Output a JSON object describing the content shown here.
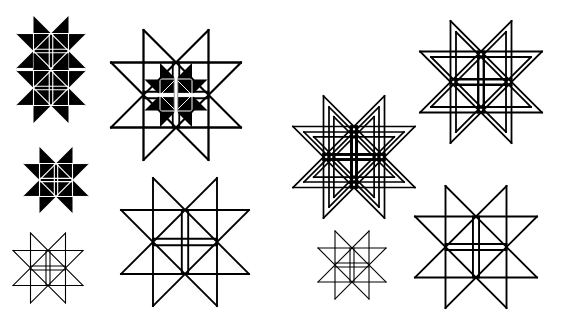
{
  "canvas": {
    "width": 562,
    "height": 336,
    "background": "#ffffff",
    "ink": "#000000"
  },
  "figures": [
    {
      "id": "double-filled-star",
      "style": "filled",
      "cx": 51,
      "cy": 51,
      "a": 17.5,
      "stroke": 1.6,
      "stack": [
        0,
        37
      ]
    },
    {
      "id": "outline-star-with-filled-core",
      "style": "outline",
      "cx": 176,
      "cy": 95,
      "a": 32.5,
      "stroke": 1.8,
      "core": {
        "style": "filled-quad",
        "a": 16
      }
    },
    {
      "id": "filled-star",
      "style": "filled",
      "cx": 56,
      "cy": 180,
      "a": 16.5,
      "stroke": 1.6
    },
    {
      "id": "small-outline-star-left",
      "style": "outline",
      "cx": 48,
      "cy": 268,
      "a": 17.5,
      "stroke": 1.1
    },
    {
      "id": "large-outline-star-left",
      "style": "outline",
      "cx": 185,
      "cy": 242,
      "a": 32,
      "stroke": 1.9
    },
    {
      "id": "triple-nested-star",
      "style": "outline",
      "cx": 354,
      "cy": 157,
      "a": 30.5,
      "stroke": 1.7,
      "nested": [
        1,
        0.82,
        0.66
      ],
      "boldCross": true
    },
    {
      "id": "double-nested-star",
      "style": "outline",
      "cx": 481,
      "cy": 82,
      "a": 30.5,
      "stroke": 1.8,
      "nested": [
        1,
        0.82
      ]
    },
    {
      "id": "small-outline-star-right",
      "style": "outline",
      "cx": 352,
      "cy": 265,
      "a": 17,
      "stroke": 1.1
    },
    {
      "id": "large-outline-star-right",
      "style": "outline",
      "cx": 476,
      "cy": 247,
      "a": 30.5,
      "stroke": 1.9
    }
  ]
}
